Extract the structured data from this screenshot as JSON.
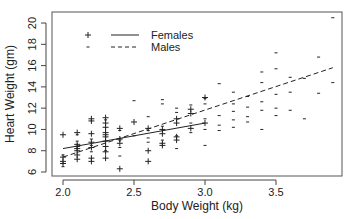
{
  "chart_data": {
    "type": "scatter",
    "title": "",
    "xlabel": "Body Weight (kg)",
    "ylabel": "Heart Weight (gm)",
    "xlim": [
      1.95,
      3.95
    ],
    "ylim": [
      5.6,
      21.0
    ],
    "xticks": [
      2.0,
      2.5,
      3.0,
      3.5
    ],
    "xtick_labels": [
      "2.0",
      "2.5",
      "3.0",
      "3.5"
    ],
    "yticks": [
      6,
      8,
      10,
      12,
      14,
      16,
      18,
      20
    ],
    "ytick_labels": [
      "6",
      "8",
      "10",
      "12",
      "14",
      "16",
      "18",
      "20"
    ],
    "grid": false,
    "legend_position": "top-left",
    "legend": [
      {
        "name": "Females",
        "marker": "+",
        "line": "solid"
      },
      {
        "name": "Males",
        "marker": "-",
        "line": "dashed"
      }
    ],
    "series": [
      {
        "name": "Females",
        "marker": "+",
        "points": [
          [
            2.0,
            7.0
          ],
          [
            2.0,
            7.4
          ],
          [
            2.0,
            6.8
          ],
          [
            2.0,
            9.5
          ],
          [
            2.1,
            7.2
          ],
          [
            2.1,
            7.6
          ],
          [
            2.1,
            8.0
          ],
          [
            2.1,
            8.2
          ],
          [
            2.1,
            8.4
          ],
          [
            2.1,
            8.6
          ],
          [
            2.1,
            9.7
          ],
          [
            2.2,
            7.0
          ],
          [
            2.2,
            7.3
          ],
          [
            2.2,
            8.3
          ],
          [
            2.2,
            8.8
          ],
          [
            2.2,
            9.6
          ],
          [
            2.2,
            10.8
          ],
          [
            2.2,
            11.0
          ],
          [
            2.3,
            7.3
          ],
          [
            2.3,
            7.9
          ],
          [
            2.3,
            8.4
          ],
          [
            2.3,
            8.9
          ],
          [
            2.3,
            9.3
          ],
          [
            2.3,
            9.5
          ],
          [
            2.3,
            9.7
          ],
          [
            2.3,
            10.2
          ],
          [
            2.3,
            10.6
          ],
          [
            2.3,
            11.1
          ],
          [
            2.4,
            6.3
          ],
          [
            2.4,
            8.7
          ],
          [
            2.4,
            9.1
          ],
          [
            2.4,
            10.1
          ],
          [
            2.5,
            10.7
          ],
          [
            2.6,
            10.1
          ],
          [
            2.6,
            8.0
          ],
          [
            2.6,
            7.0
          ],
          [
            2.7,
            10.0
          ],
          [
            2.7,
            9.6
          ],
          [
            2.7,
            8.7
          ],
          [
            2.7,
            8.5
          ],
          [
            2.8,
            10.6
          ],
          [
            2.8,
            11.0
          ],
          [
            2.8,
            9.3
          ],
          [
            2.8,
            9.0
          ],
          [
            2.9,
            11.5
          ],
          [
            2.9,
            11.9
          ],
          [
            2.9,
            10.1
          ],
          [
            3.0,
            10.6
          ],
          [
            3.0,
            13.0
          ]
        ]
      },
      {
        "name": "Males",
        "marker": "-",
        "points": [
          [
            2.0,
            6.5
          ],
          [
            2.0,
            7.6
          ],
          [
            2.1,
            8.9
          ],
          [
            2.1,
            9.5
          ],
          [
            2.2,
            7.9
          ],
          [
            2.2,
            8.5
          ],
          [
            2.2,
            9.1
          ],
          [
            2.3,
            8.0
          ],
          [
            2.3,
            10.9
          ],
          [
            2.4,
            7.5
          ],
          [
            2.4,
            8.3
          ],
          [
            2.4,
            9.0
          ],
          [
            2.4,
            9.9
          ],
          [
            2.5,
            9.4
          ],
          [
            2.5,
            12.7
          ],
          [
            2.6,
            8.8
          ],
          [
            2.6,
            9.2
          ],
          [
            2.6,
            9.9
          ],
          [
            2.6,
            11.2
          ],
          [
            2.7,
            9.0
          ],
          [
            2.7,
            10.3
          ],
          [
            2.7,
            12.4
          ],
          [
            2.7,
            12.8
          ],
          [
            2.8,
            8.2
          ],
          [
            2.8,
            9.4
          ],
          [
            2.8,
            11.6
          ],
          [
            2.8,
            12.0
          ],
          [
            2.9,
            9.7
          ],
          [
            2.9,
            10.6
          ],
          [
            2.9,
            12.3
          ],
          [
            3.0,
            8.5
          ],
          [
            3.0,
            10.0
          ],
          [
            3.0,
            11.0
          ],
          [
            3.0,
            12.4
          ],
          [
            3.0,
            12.9
          ],
          [
            3.1,
            9.9
          ],
          [
            3.1,
            10.4
          ],
          [
            3.1,
            11.3
          ],
          [
            3.1,
            14.3
          ],
          [
            3.2,
            10.2
          ],
          [
            3.2,
            10.9
          ],
          [
            3.2,
            11.7
          ],
          [
            3.2,
            12.4
          ],
          [
            3.2,
            13.5
          ],
          [
            3.3,
            10.7
          ],
          [
            3.3,
            11.2
          ],
          [
            3.3,
            12.1
          ],
          [
            3.3,
            13.1
          ],
          [
            3.4,
            10.0
          ],
          [
            3.4,
            11.8
          ],
          [
            3.4,
            12.6
          ],
          [
            3.4,
            14.4
          ],
          [
            3.4,
            15.4
          ],
          [
            3.5,
            11.3
          ],
          [
            3.5,
            12.0
          ],
          [
            3.5,
            13.3
          ],
          [
            3.5,
            15.7
          ],
          [
            3.5,
            17.2
          ],
          [
            3.6,
            11.8
          ],
          [
            3.6,
            13.5
          ],
          [
            3.6,
            14.9
          ],
          [
            3.7,
            11.0
          ],
          [
            3.7,
            14.8
          ],
          [
            3.8,
            13.4
          ],
          [
            3.8,
            16.8
          ],
          [
            3.9,
            14.4
          ],
          [
            3.9,
            20.5
          ]
        ]
      }
    ],
    "fit_lines": [
      {
        "name": "Females",
        "style": "solid",
        "x": [
          2.0,
          3.0
        ],
        "y": [
          8.2,
          10.6
        ]
      },
      {
        "name": "Males",
        "style": "dashed",
        "x": [
          2.0,
          3.9
        ],
        "y": [
          7.4,
          15.8
        ]
      }
    ],
    "colors": {
      "ink": "#222222",
      "axis": "#444444",
      "background": "#ffffff"
    }
  }
}
